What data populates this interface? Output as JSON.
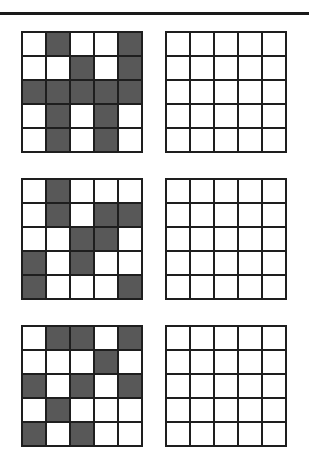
{
  "colors": {
    "filled": "#585858",
    "empty": "#ffffff",
    "line": "#1e1e1e"
  },
  "puzzles": [
    {
      "pattern": [
        [
          0,
          1,
          0,
          0,
          1
        ],
        [
          0,
          0,
          1,
          0,
          1
        ],
        [
          1,
          1,
          1,
          1,
          1
        ],
        [
          0,
          1,
          0,
          1,
          0
        ],
        [
          0,
          1,
          0,
          1,
          0
        ]
      ],
      "answer": [
        [
          0,
          0,
          0,
          0,
          0
        ],
        [
          0,
          0,
          0,
          0,
          0
        ],
        [
          0,
          0,
          0,
          0,
          0
        ],
        [
          0,
          0,
          0,
          0,
          0
        ],
        [
          0,
          0,
          0,
          0,
          0
        ]
      ]
    },
    {
      "pattern": [
        [
          0,
          1,
          0,
          0,
          0
        ],
        [
          0,
          1,
          0,
          1,
          1
        ],
        [
          0,
          0,
          1,
          1,
          0
        ],
        [
          1,
          0,
          1,
          0,
          0
        ],
        [
          1,
          0,
          0,
          0,
          1
        ]
      ],
      "answer": [
        [
          0,
          0,
          0,
          0,
          0
        ],
        [
          0,
          0,
          0,
          0,
          0
        ],
        [
          0,
          0,
          0,
          0,
          0
        ],
        [
          0,
          0,
          0,
          0,
          0
        ],
        [
          0,
          0,
          0,
          0,
          0
        ]
      ]
    },
    {
      "pattern": [
        [
          0,
          1,
          1,
          0,
          1
        ],
        [
          0,
          0,
          0,
          1,
          0
        ],
        [
          1,
          0,
          1,
          0,
          1
        ],
        [
          0,
          1,
          0,
          0,
          0
        ],
        [
          1,
          0,
          1,
          0,
          0
        ]
      ],
      "answer": [
        [
          0,
          0,
          0,
          0,
          0
        ],
        [
          0,
          0,
          0,
          0,
          0
        ],
        [
          0,
          0,
          0,
          0,
          0
        ],
        [
          0,
          0,
          0,
          0,
          0
        ],
        [
          0,
          0,
          0,
          0,
          0
        ]
      ]
    }
  ]
}
